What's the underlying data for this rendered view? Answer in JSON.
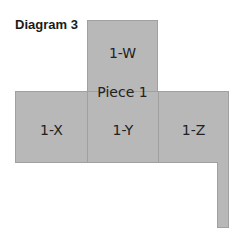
{
  "title": "Diagram 3",
  "piece_label": "Piece 1",
  "cells": {
    "w": "1-W",
    "x": "1-X",
    "y": "1-Y",
    "z": "1-Z"
  },
  "colors": {
    "fill": "#b8b8b8",
    "border": "#a0a0a0"
  }
}
